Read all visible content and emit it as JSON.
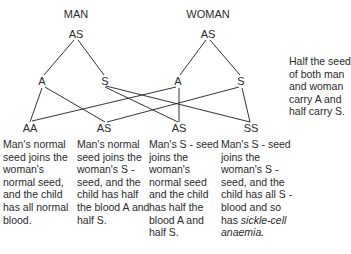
{
  "diagram": {
    "parents": {
      "man": {
        "title": "MAN",
        "genotype": "AS",
        "seeds": [
          "A",
          "S"
        ]
      },
      "woman": {
        "title": "WOMAN",
        "genotype": "AS",
        "seeds": [
          "A",
          "S"
        ]
      }
    },
    "children": [
      {
        "genotype": "AA",
        "desc": "Man's normal seed joins the woman's normal seed, and the child has all normal blood."
      },
      {
        "genotype": "AS",
        "desc": "Man's normal seed joins the woman's S - seed, and the child has half the blood A and half S."
      },
      {
        "genotype": "AS",
        "desc": "Man's S - seed joins the woman's normal seed and the child has half the blood A and half S."
      },
      {
        "genotype": "SS",
        "desc": "Man's S - seed joins the woman's S - seed, and the child has all S - blood and so has",
        "desc_em": "sickle-cell anaemia."
      }
    ],
    "note": "Half the seed of both man and woman carry A and half carry S.",
    "line_color": "#333333"
  }
}
